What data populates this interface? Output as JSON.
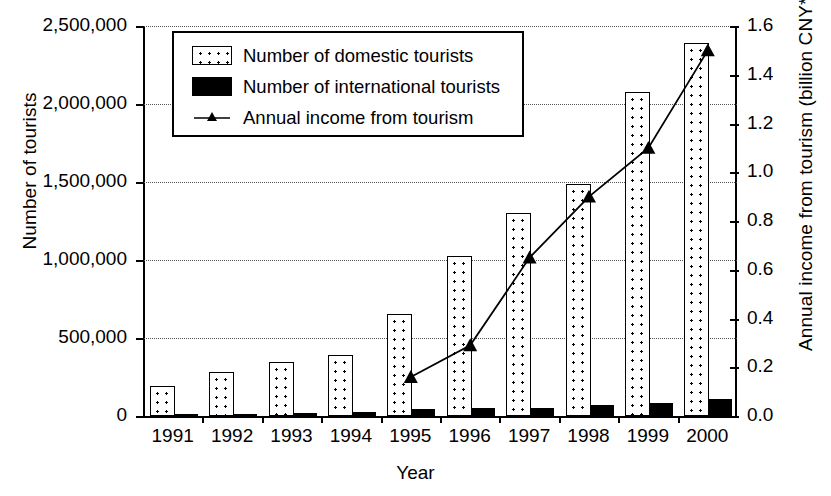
{
  "chart_data": {
    "type": "bar",
    "title": "",
    "xlabel": "Year",
    "ylabel": "Number of tourists",
    "y2label": "Annual income from tourism (billion CNY*)",
    "categories": [
      "1991",
      "1992",
      "1993",
      "1994",
      "1995",
      "1996",
      "1997",
      "1998",
      "1999",
      "2000"
    ],
    "ylim": [
      0,
      2500000
    ],
    "y2lim": [
      0,
      1.6
    ],
    "yticks": [
      0,
      500000,
      1000000,
      1500000,
      2000000,
      2500000
    ],
    "ytick_labels": [
      "0",
      "500,000",
      "1,000,000",
      "1,500,000",
      "2,000,000",
      "2,500,000"
    ],
    "y2ticks": [
      0.0,
      0.2,
      0.4,
      0.6,
      0.8,
      1.0,
      1.2,
      1.4,
      1.6
    ],
    "y2tick_labels": [
      "0.0",
      "0.2",
      "0.4",
      "0.6",
      "0.8",
      "1.0",
      "1.2",
      "1.4",
      "1.6"
    ],
    "grid": true,
    "grid_style": "dotted horizontal",
    "legend_position": "top-left inside",
    "series": [
      {
        "name": "Number of domestic tourists",
        "type": "bar",
        "axis": "left",
        "fill": "dotted-pattern",
        "values": [
          190000,
          285000,
          345000,
          390000,
          655000,
          1025000,
          1300000,
          1490000,
          2080000,
          2390000
        ]
      },
      {
        "name": "Number of international tourists",
        "type": "bar",
        "axis": "left",
        "fill": "solid-black",
        "values": [
          11000,
          15000,
          22000,
          26000,
          48000,
          50000,
          52000,
          68000,
          82000,
          110000
        ]
      },
      {
        "name": "Annual income from tourism",
        "type": "line",
        "axis": "right",
        "marker": "triangle",
        "values": [
          null,
          null,
          null,
          null,
          0.16,
          0.29,
          0.65,
          0.9,
          1.1,
          1.5
        ]
      }
    ]
  },
  "axes": {
    "left_title": "Number of tourists",
    "right_title": "Annual income from tourism (billion CNY*)",
    "bottom_title": "Year"
  },
  "legend": {
    "items": [
      {
        "label": "Number of domestic tourists",
        "key": "dotted-swatch"
      },
      {
        "label": "Number of international tourists",
        "key": "black-swatch"
      },
      {
        "label": "Annual income from tourism",
        "key": "line-triangle-marker"
      }
    ]
  },
  "colors": {
    "ink": "#000000",
    "background": "#ffffff",
    "grid": "#555555"
  }
}
